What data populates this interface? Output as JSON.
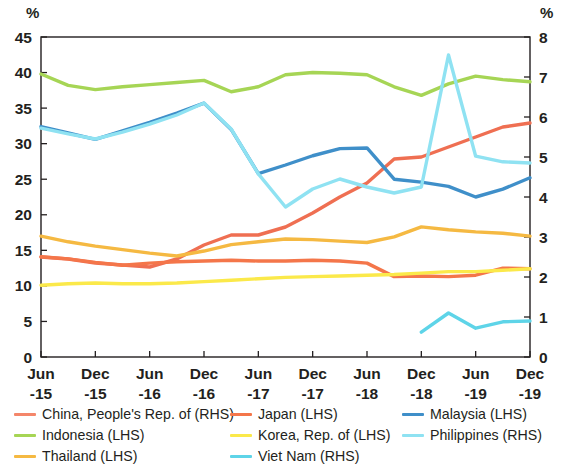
{
  "axis": {
    "left_unit": "%",
    "right_unit": "%",
    "left_ticks": [
      "45",
      "40",
      "35",
      "30",
      "25",
      "20",
      "15",
      "10",
      "5",
      "0"
    ],
    "right_ticks": [
      "8",
      "7",
      "6",
      "5",
      "4",
      "3",
      "2",
      "1",
      "0"
    ],
    "x_tick_top": [
      "Jun",
      "Dec",
      "Jun",
      "Dec",
      "Jun",
      "Dec",
      "Jun",
      "Dec",
      "Jun",
      "Dec"
    ],
    "x_tick_bottom": [
      "-15",
      "-15",
      "-16",
      "-16",
      "-17",
      "-17",
      "-18",
      "-18",
      "-19",
      "-19"
    ]
  },
  "legend": {
    "columns": [
      {
        "items": [
          {
            "label": "China, People's Rep. of (RHS)",
            "color": "#f4866a",
            "name": "china"
          },
          {
            "label": "Indonesia (LHS)",
            "color": "#a6d555",
            "name": "indonesia"
          },
          {
            "label": "Thailand (LHS)",
            "color": "#f5b942",
            "name": "thailand"
          }
        ]
      },
      {
        "items": [
          {
            "label": "Japan (LHS)",
            "color": "#f4764a",
            "name": "japan"
          },
          {
            "label": "Korea, Rep. of (LHS)",
            "color": "#fbe94a",
            "name": "korea"
          },
          {
            "label": "Viet Nam (RHS)",
            "color": "#5ed4e8",
            "name": "vietnam"
          }
        ]
      },
      {
        "items": [
          {
            "label": "Malaysia (LHS)",
            "color": "#3f8fc9",
            "name": "malaysia"
          },
          {
            "label": "Philippines (RHS)",
            "color": "#8fe2f2",
            "name": "philippines"
          }
        ]
      }
    ]
  },
  "chart_data": {
    "type": "line",
    "title": "",
    "xlabel": "",
    "ylabel": "%",
    "y2label": "%",
    "ylim": [
      0,
      45
    ],
    "y2lim": [
      0,
      8
    ],
    "grid": false,
    "legend_position": "bottom",
    "x": [
      "Jun-15",
      "Sep-15",
      "Dec-15",
      "Mar-16",
      "Jun-16",
      "Sep-16",
      "Dec-16",
      "Mar-17",
      "Jun-17",
      "Sep-17",
      "Dec-17",
      "Mar-18",
      "Jun-18",
      "Sep-18",
      "Dec-18",
      "Mar-19",
      "Jun-19",
      "Sep-19",
      "Dec-19"
    ],
    "x_tick_labels": [
      "Jun-15",
      "Dec-15",
      "Jun-16",
      "Dec-16",
      "Jun-17",
      "Dec-17",
      "Jun-18",
      "Dec-18",
      "Jun-19",
      "Dec-19"
    ],
    "series": [
      {
        "name": "China, People's Rep. of (RHS)",
        "axis": "right",
        "color": "#ef6f52",
        "values": [
          2.5,
          2.45,
          2.35,
          2.3,
          2.25,
          2.45,
          2.8,
          3.05,
          3.05,
          3.25,
          3.6,
          4.0,
          4.35,
          4.95,
          5.0,
          5.25,
          5.5,
          5.75,
          5.85
        ]
      },
      {
        "name": "Indonesia (LHS)",
        "axis": "left",
        "color": "#a6d555",
        "values": [
          39.8,
          38.2,
          37.6,
          38.0,
          38.3,
          38.6,
          38.9,
          37.3,
          38.0,
          39.7,
          40.0,
          39.9,
          39.7,
          38.0,
          36.8,
          38.4,
          39.5,
          39.0,
          38.7
        ]
      },
      {
        "name": "Thailand (LHS)",
        "axis": "left",
        "color": "#f5b942",
        "values": [
          17.0,
          16.2,
          15.6,
          15.1,
          14.6,
          14.2,
          14.9,
          15.8,
          16.2,
          16.6,
          16.5,
          16.3,
          16.1,
          16.9,
          18.3,
          17.9,
          17.6,
          17.4,
          17.0
        ]
      },
      {
        "name": "Japan (LHS)",
        "axis": "left",
        "color": "#f4764a",
        "values": [
          14.1,
          13.8,
          13.3,
          12.9,
          13.2,
          13.4,
          13.5,
          13.6,
          13.5,
          13.5,
          13.6,
          13.5,
          13.2,
          11.3,
          11.4,
          11.3,
          11.5,
          12.5,
          12.4
        ]
      },
      {
        "name": "Korea, Rep. of (LHS)",
        "axis": "left",
        "color": "#fbe94a",
        "values": [
          10.1,
          10.3,
          10.4,
          10.3,
          10.3,
          10.4,
          10.6,
          10.8,
          11.0,
          11.2,
          11.3,
          11.4,
          11.5,
          11.6,
          11.8,
          12.0,
          12.0,
          12.2,
          12.4
        ]
      },
      {
        "name": "Malaysia (LHS)",
        "axis": "left",
        "color": "#3f8fc9",
        "values": [
          32.4,
          31.5,
          30.6,
          31.8,
          33.0,
          34.3,
          35.7,
          32.0,
          25.8,
          27.0,
          28.3,
          29.3,
          29.4,
          25.0,
          24.6,
          24.0,
          22.5,
          23.6,
          25.2
        ]
      },
      {
        "name": "Philippines (RHS)",
        "axis": "right",
        "color": "#8fe2f2",
        "values": [
          5.72,
          5.58,
          5.45,
          5.62,
          5.82,
          6.05,
          6.35,
          5.7,
          4.58,
          3.75,
          4.2,
          4.45,
          4.25,
          4.1,
          4.25,
          7.55,
          5.02,
          4.88,
          4.85
        ]
      },
      {
        "name": "Viet Nam (RHS)",
        "axis": "right",
        "color": "#5ed4e8",
        "values": [
          null,
          null,
          null,
          null,
          null,
          null,
          null,
          null,
          null,
          null,
          null,
          null,
          null,
          null,
          0.62,
          1.1,
          0.72,
          0.88,
          0.9
        ]
      }
    ]
  }
}
